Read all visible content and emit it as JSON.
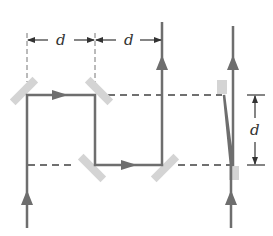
{
  "diagram": {
    "type": "optical-path-mirrors",
    "labels": {
      "top_left_dimension": "d",
      "top_right_dimension": "d",
      "right_vertical_dimension": "d"
    },
    "colors": {
      "beam": "#6e6e6e",
      "mirror": "#d4d4d4",
      "dimension": "#444444",
      "background": "#ffffff"
    },
    "components": {
      "mirrors": 6,
      "beams": [
        "left-path",
        "right-path"
      ],
      "dashed_reference_lines": 2
    }
  }
}
